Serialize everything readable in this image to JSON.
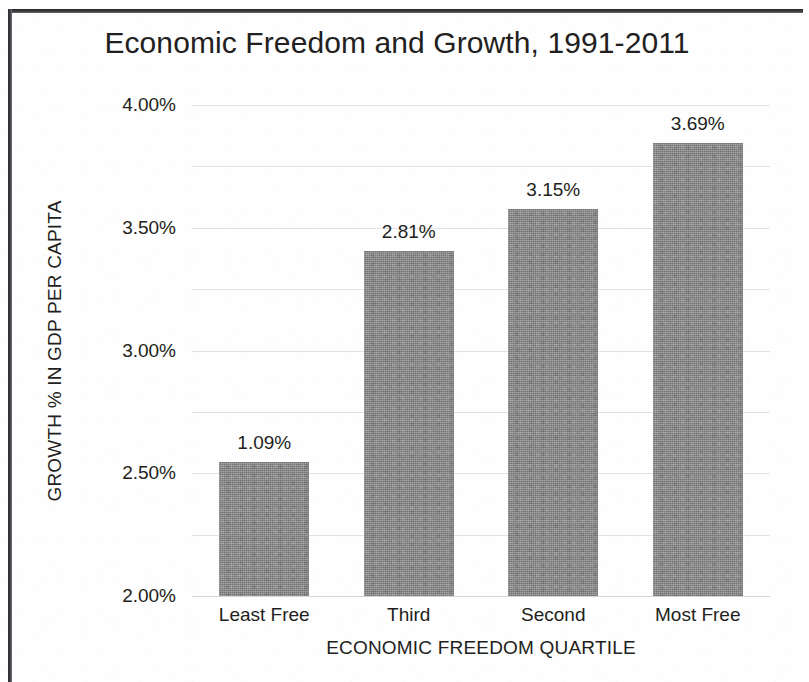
{
  "chart_data": {
    "type": "bar",
    "title": "Economic Freedom and Growth, 1991-2011",
    "xlabel": "ECONOMIC FREEDOM QUARTILE",
    "ylabel": "GROWTH % IN GDP PER CAPITA",
    "categories": [
      "Least Free",
      "Third",
      "Second",
      "Most Free"
    ],
    "values": [
      1.09,
      2.81,
      3.15,
      3.69
    ],
    "value_labels": [
      "1.09%",
      "2.81%",
      "3.15%",
      "3.69%"
    ],
    "ylim": [
      0,
      4
    ],
    "ytick_values": [
      0,
      0.5,
      1,
      1.5,
      2,
      2.5,
      3,
      3.5,
      4
    ],
    "ytick_labels": [
      "0.00%",
      "0.50%",
      "1.00%",
      "1.50%",
      "2.00%",
      "2.50%",
      "3.00%",
      "3.50%",
      "4.00%"
    ],
    "grid": true,
    "legend": null,
    "bar_color": "#8b8b8b",
    "gridline_color": "#e3e3e5",
    "text_color": "#231f20"
  }
}
